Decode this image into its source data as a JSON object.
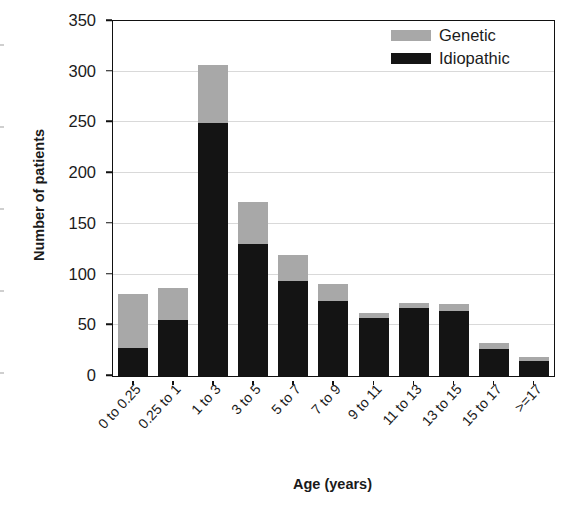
{
  "chart_data": {
    "type": "bar",
    "subtype": "stacked-vertical",
    "title": "",
    "subtitle": "",
    "xlabel": "Age (years)",
    "ylabel": "Number of patients",
    "categories": [
      "0 to 0.25",
      "0.25 to 1",
      "1 to 3",
      "3 to 5",
      "5 to 7",
      "7 to 9",
      "9 to 11",
      "11 to 13",
      "13 to 15",
      "15 to 17",
      ">=17"
    ],
    "series": [
      {
        "name": "Idiopathic",
        "color": "#141414",
        "values": [
          28,
          55,
          249,
          130,
          94,
          74,
          57,
          67,
          64,
          27,
          15
        ]
      },
      {
        "name": "Genetic",
        "color": "#a8a8a8",
        "values": [
          53,
          32,
          58,
          42,
          25,
          17,
          5,
          5,
          7,
          6,
          4
        ]
      }
    ],
    "totals": [
      81,
      87,
      307,
      172,
      119,
      91,
      62,
      72,
      71,
      33,
      19
    ],
    "ylim": [
      0,
      350
    ],
    "yticks": [
      0,
      50,
      100,
      150,
      200,
      250,
      300,
      350
    ],
    "ytick_labels": [
      "0",
      "50",
      "100",
      "150",
      "200",
      "250",
      "300",
      "350"
    ],
    "grid": "horizontal",
    "legend_position": "top-right",
    "legend_entries": [
      {
        "label": "Genetic",
        "color": "#a8a8a8"
      },
      {
        "label": "Idiopathic",
        "color": "#141414"
      }
    ]
  }
}
